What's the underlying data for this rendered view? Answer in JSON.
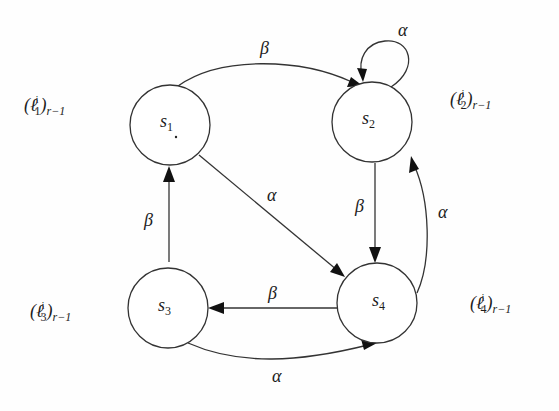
{
  "diagram": {
    "type": "state-transition-graph",
    "nodes": [
      {
        "id": "s1",
        "label": "s",
        "sub": "1",
        "cx": 170,
        "cy": 125,
        "r": 40,
        "annotation": {
          "base": "(ℓ",
          "sup": "i",
          "sub": "1",
          "tail": ")",
          "subscript": "r−1"
        }
      },
      {
        "id": "s2",
        "label": "s",
        "sub": "2",
        "cx": 372,
        "cy": 122,
        "r": 40,
        "annotation": {
          "base": "(ℓ",
          "sup": "i",
          "sub": "2",
          "tail": ")",
          "subscript": "r−1"
        }
      },
      {
        "id": "s3",
        "label": "s",
        "sub": "3",
        "cx": 168,
        "cy": 308,
        "r": 40,
        "annotation": {
          "base": "(ℓ",
          "sup": "i",
          "sub": "3",
          "tail": ")",
          "subscript": "r−1"
        }
      },
      {
        "id": "s4",
        "label": "s",
        "sub": "4",
        "cx": 377,
        "cy": 303,
        "r": 40,
        "annotation": {
          "base": "(ℓ",
          "sup": "i",
          "sub": "4",
          "tail": ")",
          "subscript": "r−1"
        }
      }
    ],
    "edges": [
      {
        "from": "s1",
        "to": "s2",
        "label": "β"
      },
      {
        "from": "s2",
        "to": "s2",
        "label": "α"
      },
      {
        "from": "s1",
        "to": "s4",
        "label": "α"
      },
      {
        "from": "s2",
        "to": "s4",
        "label": "β"
      },
      {
        "from": "s4",
        "to": "s2",
        "label": "α"
      },
      {
        "from": "s3",
        "to": "s1",
        "label": "β"
      },
      {
        "from": "s4",
        "to": "s3",
        "label": "β"
      },
      {
        "from": "s3",
        "to": "s4",
        "label": "α"
      }
    ]
  },
  "labels": {
    "s1": "s",
    "s1_sub": "1",
    "s2": "s",
    "s2_sub": "2",
    "s3": "s",
    "s3_sub": "3",
    "s4": "s",
    "s4_sub": "4",
    "edge_s1_s2": "β",
    "edge_s2_loop": "α",
    "edge_s1_s4": "α",
    "edge_s2_s4": "β",
    "edge_s4_s2": "α",
    "edge_s3_s1": "β",
    "edge_s4_s3": "β",
    "edge_s3_s4": "α",
    "ann_open": "(ℓ",
    "ann_sup": "i",
    "ann_close": ")",
    "ann_r": "r−1",
    "ann1_sub": "1",
    "ann2_sub": "2",
    "ann3_sub": "3",
    "ann4_sub": "4"
  }
}
